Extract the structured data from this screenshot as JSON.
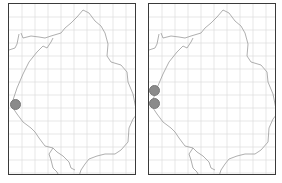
{
  "maps": [
    {
      "id": "left",
      "grid_spacing": 13,
      "outline_color": "#9a9a9a",
      "grid_color": "#dcdcdc",
      "markers": [
        {
          "x": 15,
          "y": 104,
          "color": "#8a8a8a"
        }
      ]
    },
    {
      "id": "right",
      "grid_spacing": 13,
      "outline_color": "#9a9a9a",
      "grid_color": "#dcdcdc",
      "markers": [
        {
          "x": 154,
          "y": 90,
          "color": "#8a8a8a"
        },
        {
          "x": 154,
          "y": 103,
          "color": "#8a8a8a"
        }
      ]
    }
  ]
}
